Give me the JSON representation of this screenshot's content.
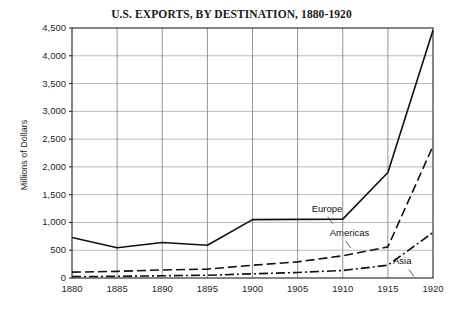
{
  "chart_data": {
    "type": "line",
    "title": "U.S. EXPORTS, BY DESTINATION, 1880-1920",
    "xlabel": "",
    "ylabel": "Millions of Dollars",
    "x": [
      1880,
      1885,
      1890,
      1895,
      1900,
      1905,
      1910,
      1915,
      1920
    ],
    "xticklabels": [
      "1880",
      "1885",
      "1890",
      "1895",
      "1900",
      "1905",
      "1910",
      "1915",
      "1920"
    ],
    "yticks": [
      0,
      500,
      1000,
      1500,
      2000,
      2500,
      3000,
      3500,
      4000,
      4500
    ],
    "yticklabels": [
      "0",
      "500",
      "1,000",
      "1,500",
      "2,000",
      "2,500",
      "3,000",
      "3,500",
      "4,000",
      "4,500"
    ],
    "xlim": [
      1880,
      1920
    ],
    "ylim": [
      0,
      4500
    ],
    "grid": true,
    "legend_position": "inline-annotations",
    "series": [
      {
        "name": "Europe",
        "style": "solid",
        "color": "#111111",
        "values": [
          730,
          545,
          640,
          590,
          1050,
          1055,
          1060,
          1900,
          4460
        ]
      },
      {
        "name": "Americas",
        "style": "dashed",
        "color": "#111111",
        "values": [
          105,
          120,
          145,
          160,
          230,
          290,
          400,
          560,
          2375
        ]
      },
      {
        "name": "Asia",
        "style": "dashdot",
        "color": "#111111",
        "values": [
          25,
          30,
          40,
          50,
          75,
          100,
          135,
          230,
          820
        ]
      }
    ],
    "annotations": [
      {
        "text": "Europe",
        "x": 1909,
        "y": 1230
      },
      {
        "text": "Americas",
        "x": 1911,
        "y": 790
      },
      {
        "text": "Asia",
        "x": 1918,
        "y": 280
      }
    ]
  }
}
